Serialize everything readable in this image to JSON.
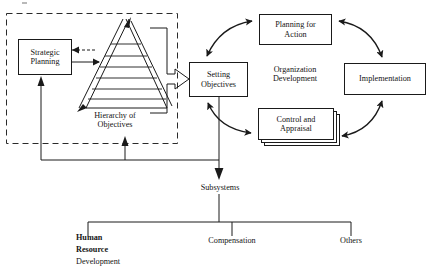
{
  "diagram": {
    "colors": {
      "stroke": "#1a1a1a",
      "text": "#141414",
      "background": "#ffffff",
      "dashed_frame": "#2a2a2a"
    },
    "dashed_frame": {
      "name": "strategic-planning-group",
      "x": 6,
      "y": 13,
      "width": 172,
      "height": 131
    },
    "nodes": [
      {
        "id": "strategic-planning",
        "label": "Strategic\nPlanning",
        "x": 18,
        "y": 39,
        "width": 54,
        "height": 36
      },
      {
        "id": "setting-objectives",
        "label": "Setting\nObjectives",
        "x": 189,
        "y": 62,
        "width": 59,
        "height": 35
      },
      {
        "id": "planning-for-action",
        "label": "Planning for\nAction",
        "x": 259,
        "y": 14,
        "width": 73,
        "height": 31
      },
      {
        "id": "implementation",
        "label": "Implementation",
        "x": 344,
        "y": 63,
        "width": 82,
        "height": 32
      },
      {
        "id": "control-and-appraisal",
        "label": "Control and\nAppraisal",
        "x": 258,
        "y": 108,
        "width": 76,
        "height": 32
      }
    ],
    "free_labels": [
      {
        "id": "hierarchy-of-objectives",
        "label": "Hierarchy of\nObjectives",
        "x": 78,
        "y": 111,
        "width": 74
      },
      {
        "id": "organization-development",
        "label": "Organization\nDevelopment",
        "x": 259,
        "y": 65,
        "width": 72
      },
      {
        "id": "subsystems",
        "label": "Subsystems",
        "x": 192,
        "y": 183,
        "width": 56
      },
      {
        "id": "compensation",
        "label": "Compensation",
        "x": 201,
        "y": 236,
        "width": 62
      },
      {
        "id": "others",
        "label": "Others",
        "x": 334,
        "y": 236,
        "width": 34
      }
    ],
    "hrd_label": {
      "id": "human-resource-development",
      "line1": "Human",
      "line2": "Resource",
      "line3": "Development",
      "x": 76,
      "y": 232
    },
    "pyramid": {
      "id": "hierarchy-of-objectives-pyramid",
      "apex_x": 123,
      "apex_y": 19,
      "base_left_x": 79,
      "base_right_x": 167,
      "base_y": 108,
      "levels": 7
    },
    "subsystem_tree": {
      "trunk_x": 219,
      "trunk_top_y": 192,
      "bar_y": 222,
      "left_x": 88,
      "right_x": 351,
      "branches": [
        {
          "label_ref": "human-resource-development",
          "x": 88
        },
        {
          "label_ref": "compensation",
          "x": 232
        },
        {
          "label_ref": "others",
          "x": 351
        }
      ]
    }
  }
}
